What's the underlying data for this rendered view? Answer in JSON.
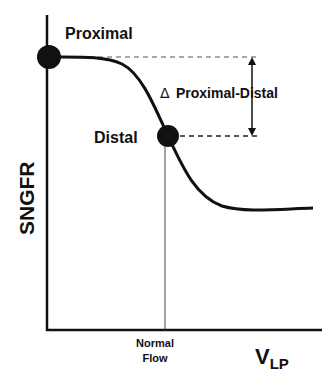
{
  "labels": {
    "proximal": "Proximal",
    "distal": "Distal",
    "delta_symbol": "Δ",
    "delta_text": "Proximal-Distal",
    "y_axis": "SNGFR",
    "x_axis_main": "V",
    "x_axis_sub": "LP",
    "normal_flow_line1": "Normal",
    "normal_flow_line2": "Flow"
  },
  "colors": {
    "ink": "#111111",
    "background": "#ffffff"
  },
  "diagram": {
    "type": "schematic-curve",
    "points": [
      {
        "name": "Proximal",
        "x": 49,
        "y": 57
      },
      {
        "name": "Distal",
        "x": 168,
        "y": 136
      }
    ]
  }
}
